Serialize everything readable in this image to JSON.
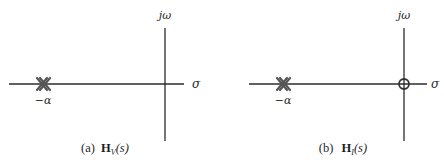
{
  "figure": {
    "panels": [
      {
        "id": "a",
        "caption_prefix": "(a)",
        "caption_func": "H",
        "caption_sub": "V",
        "caption_arg": "(s)",
        "axis_vertical_label": "jω",
        "axis_horizontal_label": "σ",
        "pole_label": "−α",
        "markers": [
          {
            "type": "double-pole",
            "position": "-alpha"
          }
        ]
      },
      {
        "id": "b",
        "caption_prefix": "(b)",
        "caption_func": "H",
        "caption_sub": "I",
        "caption_arg": "(s)",
        "axis_vertical_label": "jω",
        "axis_horizontal_label": "σ",
        "pole_label": "−α",
        "markers": [
          {
            "type": "double-pole",
            "position": "-alpha"
          },
          {
            "type": "zero",
            "position": "origin"
          }
        ]
      }
    ],
    "colors": {
      "axis": "#2b2b2b",
      "pole": "#555555",
      "zero": "#333333",
      "text": "#222222"
    }
  }
}
